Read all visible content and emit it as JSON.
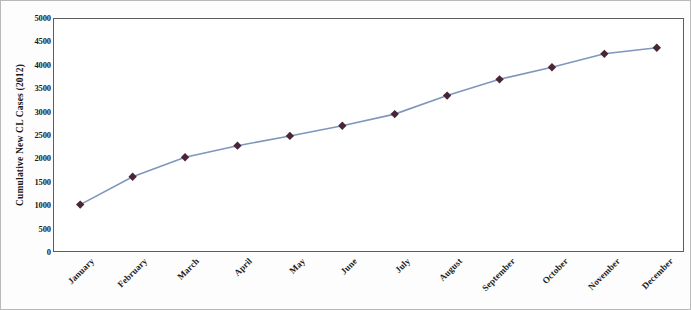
{
  "chart_data": {
    "type": "line",
    "title": "",
    "xlabel": "",
    "ylabel": "Cumulative New  CL Cases (2012)",
    "categories": [
      "January",
      "February",
      "March",
      "April",
      "May",
      "June",
      "July",
      "August",
      "September",
      "October",
      "November",
      "December"
    ],
    "values": [
      1000,
      1600,
      2020,
      2270,
      2480,
      2700,
      2950,
      3350,
      3700,
      3960,
      4250,
      4380
    ],
    "series": [
      {
        "name": "Cumulative New CL Cases (2012)",
        "values": [
          1000,
          1600,
          2020,
          2270,
          2480,
          2700,
          2950,
          3350,
          3700,
          3960,
          4250,
          4380
        ]
      }
    ],
    "ylim": [
      0,
      5000
    ],
    "ytick_values": [
      0,
      500,
      1000,
      1500,
      2000,
      2500,
      3000,
      3500,
      4000,
      4500,
      5000
    ],
    "ytick_labels": [
      "0",
      "500",
      "1000",
      "1500",
      "2000",
      "2500",
      "3000",
      "3500",
      "4000",
      "4500",
      "5000"
    ],
    "grid": false,
    "legend": false,
    "legend_position": "none",
    "line_color": "#7f96bd",
    "marker_color": "#4a2535",
    "marker_shape": "diamond",
    "axis_color": "#5d5d5d",
    "background_color": "#ffffff"
  }
}
